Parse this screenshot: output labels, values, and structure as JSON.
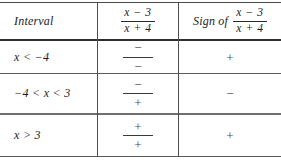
{
  "table": {
    "headers": {
      "interval": "Interval",
      "expression_numerator": "x − 3",
      "expression_denominator": "x + 4",
      "sign_of_label": "Sign of",
      "sign_numerator": "x − 3",
      "sign_denominator": "x + 4"
    },
    "rows": [
      {
        "interval": "x < −4",
        "factor_numerator": "−",
        "factor_denominator": "−",
        "sign": "+"
      },
      {
        "interval": "−4 < x < 3",
        "factor_numerator": "−",
        "factor_denominator": "+",
        "sign": "−"
      },
      {
        "interval": "x > 3",
        "factor_numerator": "+",
        "factor_denominator": "+",
        "sign": "+"
      }
    ]
  },
  "colors": {
    "text": "#1c1c1c",
    "rule": "#3a3a3a",
    "background": "#ffffff"
  }
}
